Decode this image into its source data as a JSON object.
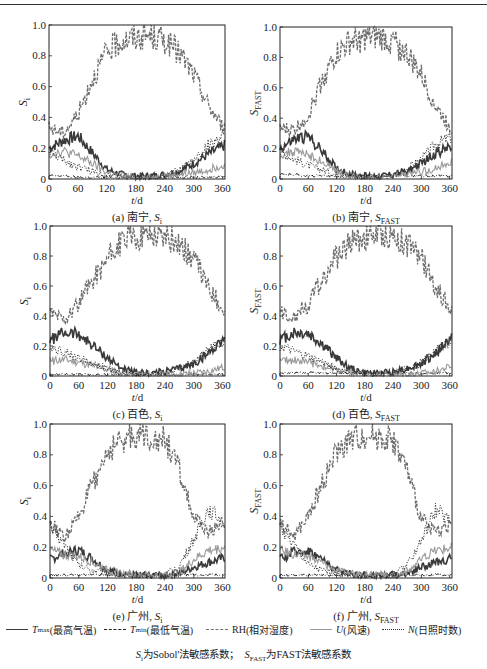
{
  "figure": {
    "legend": [
      {
        "symbol": "T",
        "sub": "max",
        "label": "(最高气温)",
        "style": "solid",
        "color": "#3a3a3a",
        "width": 1.6
      },
      {
        "symbol": "T",
        "sub": "min",
        "label": "(最低气温)",
        "style": "dashdot",
        "color": "#222222",
        "width": 1.1
      },
      {
        "symbol": "RH",
        "sub": "",
        "label": "(相对湿度)",
        "style": "dashed",
        "color": "#6e6e6e",
        "width": 1.3
      },
      {
        "symbol": "U",
        "sub": "",
        "label": "(风速)",
        "style": "solid-thin",
        "color": "#9a9a9a",
        "width": 1.1
      },
      {
        "symbol": "N",
        "sub": "",
        "label": "(日照时数)",
        "style": "dotted",
        "color": "#333333",
        "width": 1.1
      }
    ],
    "footnote": {
      "part1_symbol": "S",
      "part1_sub": "i",
      "part1_text": "为Sobol'法敏感系数；",
      "part2_symbol": "S",
      "part2_sub": "FAST",
      "part2_text": "为FAST法敏感系数"
    }
  },
  "chart_data": [
    {
      "id": "a",
      "type": "line",
      "caption_prefix": "(a) 南宁,",
      "caption_symbol": "S",
      "caption_sub": "i",
      "ylabel_symbol": "S",
      "ylabel_sub": "i",
      "xlabel": "t/d",
      "xlim": [
        0,
        365
      ],
      "ylim": [
        0,
        1.0
      ],
      "xticks": [
        0,
        60,
        120,
        180,
        240,
        300,
        360
      ],
      "yticks": [
        0,
        0.2,
        0.4,
        0.6,
        0.8,
        1.0
      ],
      "ytick_labels": [
        "0",
        "0.2",
        "0.4",
        "0.6",
        "0.8",
        "1.0"
      ],
      "x": [
        0,
        30,
        60,
        90,
        120,
        150,
        180,
        210,
        240,
        270,
        300,
        330,
        365
      ],
      "series": [
        {
          "name": "Tmax",
          "values": [
            0.2,
            0.25,
            0.28,
            0.17,
            0.06,
            0.03,
            0.02,
            0.02,
            0.03,
            0.05,
            0.1,
            0.16,
            0.22
          ]
        },
        {
          "name": "Tmin",
          "values": [
            0.02,
            0.02,
            0.01,
            0.01,
            0.01,
            0.01,
            0.01,
            0.01,
            0.01,
            0.01,
            0.01,
            0.01,
            0.02
          ]
        },
        {
          "name": "RH",
          "values": [
            0.33,
            0.3,
            0.42,
            0.65,
            0.82,
            0.9,
            0.92,
            0.93,
            0.9,
            0.82,
            0.68,
            0.48,
            0.32
          ]
        },
        {
          "name": "U",
          "values": [
            0.16,
            0.18,
            0.15,
            0.1,
            0.04,
            0.02,
            0.01,
            0.01,
            0.02,
            0.03,
            0.04,
            0.06,
            0.1
          ]
        },
        {
          "name": "N",
          "values": [
            0.18,
            0.12,
            0.08,
            0.05,
            0.03,
            0.02,
            0.01,
            0.01,
            0.02,
            0.06,
            0.12,
            0.22,
            0.28
          ]
        }
      ]
    },
    {
      "id": "b",
      "type": "line",
      "caption_prefix": "(b) 南宁,",
      "caption_symbol": "S",
      "caption_sub": "FAST",
      "ylabel_symbol": "S",
      "ylabel_sub": "FAST",
      "xlabel": "t/d",
      "xlim": [
        0,
        365
      ],
      "ylim": [
        0,
        1.0
      ],
      "xticks": [
        0,
        60,
        120,
        180,
        240,
        300,
        360
      ],
      "yticks": [
        0,
        0.2,
        0.4,
        0.6,
        0.8,
        1.0
      ],
      "ytick_labels": [
        "0",
        "0.2",
        "0.4",
        "0.6",
        "0.8",
        "1.0"
      ],
      "x": [
        0,
        30,
        60,
        90,
        120,
        150,
        180,
        210,
        240,
        270,
        300,
        330,
        365
      ],
      "series": [
        {
          "name": "Tmax",
          "values": [
            0.2,
            0.26,
            0.28,
            0.18,
            0.07,
            0.03,
            0.02,
            0.02,
            0.03,
            0.05,
            0.1,
            0.17,
            0.22
          ]
        },
        {
          "name": "Tmin",
          "values": [
            0.03,
            0.03,
            0.02,
            0.02,
            0.02,
            0.02,
            0.02,
            0.02,
            0.02,
            0.02,
            0.02,
            0.02,
            0.02
          ]
        },
        {
          "name": "RH",
          "values": [
            0.33,
            0.32,
            0.42,
            0.66,
            0.82,
            0.9,
            0.92,
            0.93,
            0.9,
            0.82,
            0.68,
            0.48,
            0.32
          ]
        },
        {
          "name": "U",
          "values": [
            0.16,
            0.18,
            0.16,
            0.11,
            0.05,
            0.02,
            0.01,
            0.01,
            0.02,
            0.03,
            0.05,
            0.07,
            0.12
          ]
        },
        {
          "name": "N",
          "values": [
            0.18,
            0.13,
            0.09,
            0.06,
            0.03,
            0.02,
            0.01,
            0.01,
            0.02,
            0.07,
            0.13,
            0.23,
            0.28
          ]
        }
      ]
    },
    {
      "id": "c",
      "type": "line",
      "caption_prefix": "(c) 百色,",
      "caption_symbol": "S",
      "caption_sub": "i",
      "ylabel_symbol": "S",
      "ylabel_sub": "i",
      "xlabel": "t/d",
      "xlim": [
        0,
        365
      ],
      "ylim": [
        0,
        1.0
      ],
      "xticks": [
        0,
        60,
        120,
        180,
        240,
        300,
        360
      ],
      "yticks": [
        0,
        0.2,
        0.4,
        0.6,
        0.8,
        1.0
      ],
      "ytick_labels": [
        "0",
        "0.2",
        "0.4",
        "0.6",
        "0.8",
        "1.0"
      ],
      "x": [
        0,
        30,
        60,
        90,
        120,
        150,
        180,
        210,
        240,
        270,
        300,
        330,
        365
      ],
      "series": [
        {
          "name": "Tmax",
          "values": [
            0.24,
            0.29,
            0.28,
            0.2,
            0.12,
            0.05,
            0.02,
            0.02,
            0.03,
            0.05,
            0.08,
            0.15,
            0.26
          ]
        },
        {
          "name": "Tmin",
          "values": [
            0.01,
            0.01,
            0.01,
            0.01,
            0.01,
            0.01,
            0.01,
            0.01,
            0.01,
            0.01,
            0.01,
            0.01,
            0.01
          ]
        },
        {
          "name": "RH",
          "values": [
            0.43,
            0.38,
            0.48,
            0.65,
            0.78,
            0.9,
            0.93,
            0.95,
            0.93,
            0.88,
            0.78,
            0.6,
            0.42
          ]
        },
        {
          "name": "U",
          "values": [
            0.1,
            0.11,
            0.09,
            0.07,
            0.04,
            0.02,
            0.01,
            0.01,
            0.01,
            0.01,
            0.02,
            0.03,
            0.06
          ]
        },
        {
          "name": "N",
          "values": [
            0.2,
            0.16,
            0.12,
            0.08,
            0.05,
            0.02,
            0.01,
            0.01,
            0.02,
            0.05,
            0.09,
            0.17,
            0.24
          ]
        }
      ]
    },
    {
      "id": "d",
      "type": "line",
      "caption_prefix": "(d) 百色,",
      "caption_symbol": "S",
      "caption_sub": "FAST",
      "ylabel_symbol": "S",
      "ylabel_sub": "FAST",
      "xlabel": "t/d",
      "xlim": [
        0,
        365
      ],
      "ylim": [
        0,
        1.0
      ],
      "xticks": [
        0,
        60,
        120,
        180,
        240,
        300,
        360
      ],
      "yticks": [
        0,
        0.2,
        0.4,
        0.6,
        0.8,
        1.0
      ],
      "ytick_labels": [
        "0",
        "0.2",
        "0.4",
        "0.6",
        "0.8",
        "1.0"
      ],
      "x": [
        0,
        30,
        60,
        90,
        120,
        150,
        180,
        210,
        240,
        270,
        300,
        330,
        365
      ],
      "series": [
        {
          "name": "Tmax",
          "values": [
            0.24,
            0.29,
            0.28,
            0.21,
            0.12,
            0.05,
            0.02,
            0.02,
            0.03,
            0.05,
            0.08,
            0.15,
            0.26
          ]
        },
        {
          "name": "Tmin",
          "values": [
            0.02,
            0.02,
            0.02,
            0.02,
            0.02,
            0.02,
            0.02,
            0.02,
            0.02,
            0.02,
            0.02,
            0.02,
            0.02
          ]
        },
        {
          "name": "RH",
          "values": [
            0.42,
            0.4,
            0.48,
            0.65,
            0.79,
            0.9,
            0.93,
            0.95,
            0.93,
            0.88,
            0.78,
            0.6,
            0.42
          ]
        },
        {
          "name": "U",
          "values": [
            0.1,
            0.11,
            0.09,
            0.07,
            0.04,
            0.02,
            0.01,
            0.01,
            0.01,
            0.01,
            0.02,
            0.03,
            0.07
          ]
        },
        {
          "name": "N",
          "values": [
            0.2,
            0.16,
            0.13,
            0.09,
            0.05,
            0.02,
            0.01,
            0.01,
            0.02,
            0.05,
            0.09,
            0.17,
            0.24
          ]
        }
      ]
    },
    {
      "id": "e",
      "type": "line",
      "caption_prefix": "(e) 广州,",
      "caption_symbol": "S",
      "caption_sub": "i",
      "ylabel_symbol": "S",
      "ylabel_sub": "i",
      "xlabel": "t/d",
      "xlim": [
        0,
        365
      ],
      "ylim": [
        0,
        1.0
      ],
      "xticks": [
        0,
        60,
        120,
        180,
        240,
        300,
        360
      ],
      "yticks": [
        0,
        0.2,
        0.4,
        0.6,
        0.8,
        1.0
      ],
      "ytick_labels": [
        "0",
        "0.2",
        "0.4",
        "0.6",
        "0.8",
        "1.0"
      ],
      "x": [
        0,
        30,
        60,
        90,
        120,
        150,
        180,
        210,
        240,
        270,
        300,
        330,
        365
      ],
      "series": [
        {
          "name": "Tmax",
          "values": [
            0.12,
            0.16,
            0.18,
            0.12,
            0.05,
            0.03,
            0.02,
            0.02,
            0.02,
            0.03,
            0.07,
            0.1,
            0.13
          ]
        },
        {
          "name": "Tmin",
          "values": [
            0.02,
            0.02,
            0.02,
            0.02,
            0.02,
            0.02,
            0.02,
            0.02,
            0.02,
            0.02,
            0.02,
            0.02,
            0.02
          ]
        },
        {
          "name": "RH",
          "values": [
            0.36,
            0.26,
            0.4,
            0.62,
            0.82,
            0.9,
            0.93,
            0.92,
            0.9,
            0.7,
            0.38,
            0.3,
            0.36
          ]
        },
        {
          "name": "U",
          "values": [
            0.18,
            0.15,
            0.14,
            0.1,
            0.05,
            0.03,
            0.02,
            0.02,
            0.02,
            0.04,
            0.12,
            0.18,
            0.2
          ]
        },
        {
          "name": "N",
          "values": [
            0.33,
            0.22,
            0.08,
            0.05,
            0.03,
            0.01,
            0.01,
            0.01,
            0.02,
            0.08,
            0.25,
            0.45,
            0.36
          ]
        }
      ]
    },
    {
      "id": "f",
      "type": "line",
      "caption_prefix": "(f) 广州,",
      "caption_symbol": "S",
      "caption_sub": "FAST",
      "ylabel_symbol": "S",
      "ylabel_sub": "FAST",
      "xlabel": "t/d",
      "xlim": [
        0,
        365
      ],
      "ylim": [
        0,
        1.0
      ],
      "xticks": [
        0,
        60,
        120,
        180,
        240,
        300,
        360
      ],
      "yticks": [
        0,
        0.2,
        0.4,
        0.6,
        0.8,
        1.0
      ],
      "ytick_labels": [
        "0",
        "0.2",
        "0.4",
        "0.6",
        "0.8",
        "1.0"
      ],
      "x": [
        0,
        30,
        60,
        90,
        120,
        150,
        180,
        210,
        240,
        270,
        300,
        330,
        365
      ],
      "series": [
        {
          "name": "Tmax",
          "values": [
            0.12,
            0.17,
            0.18,
            0.12,
            0.05,
            0.03,
            0.02,
            0.02,
            0.02,
            0.03,
            0.07,
            0.1,
            0.13
          ]
        },
        {
          "name": "Tmin",
          "values": [
            0.02,
            0.02,
            0.02,
            0.02,
            0.02,
            0.02,
            0.02,
            0.02,
            0.02,
            0.02,
            0.02,
            0.02,
            0.02
          ]
        },
        {
          "name": "RH",
          "values": [
            0.36,
            0.27,
            0.4,
            0.62,
            0.82,
            0.9,
            0.93,
            0.92,
            0.9,
            0.7,
            0.38,
            0.3,
            0.36
          ]
        },
        {
          "name": "U",
          "values": [
            0.18,
            0.16,
            0.14,
            0.1,
            0.05,
            0.03,
            0.02,
            0.02,
            0.02,
            0.04,
            0.12,
            0.18,
            0.2
          ]
        },
        {
          "name": "N",
          "values": [
            0.33,
            0.22,
            0.09,
            0.05,
            0.03,
            0.01,
            0.01,
            0.01,
            0.02,
            0.08,
            0.25,
            0.45,
            0.36
          ]
        }
      ]
    }
  ]
}
